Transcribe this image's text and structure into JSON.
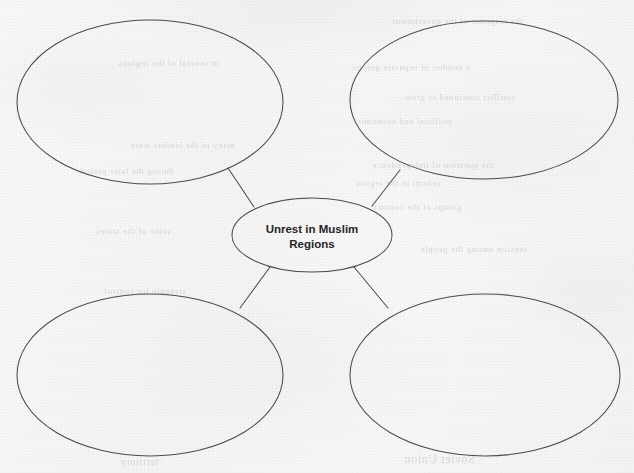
{
  "worksheet": {
    "type": "concept-map",
    "paper_color": "#f6f6f4",
    "ink_color": "#4a4a52",
    "text_color": "#26262b",
    "width": 634,
    "height": 473
  },
  "diagram": {
    "center_node": {
      "id": "center",
      "label_line1": "Unrest in Muslim",
      "label_line2": "Regions",
      "filled": true,
      "cx": 312,
      "cy": 235,
      "rx": 80,
      "ry": 37
    },
    "branch_nodes": [
      {
        "id": "top-left",
        "label": "",
        "filled": false,
        "cx": 150,
        "cy": 102,
        "rx": 133,
        "ry": 82
      },
      {
        "id": "top-right",
        "label": "",
        "filled": false,
        "cx": 484,
        "cy": 100,
        "rx": 134,
        "ry": 79
      },
      {
        "id": "bottom-left",
        "label": "",
        "filled": false,
        "cx": 150,
        "cy": 375,
        "rx": 133,
        "ry": 81
      },
      {
        "id": "bottom-right",
        "label": "",
        "filled": false,
        "cx": 485,
        "cy": 375,
        "rx": 135,
        "ry": 81
      }
    ],
    "connectors": [
      {
        "id": "center-to-top-left",
        "from": "top-left",
        "to": "center",
        "x1": 228,
        "y1": 168,
        "x2": 254,
        "y2": 207
      },
      {
        "id": "center-to-top-right",
        "from": "top-right",
        "to": "center",
        "x1": 400,
        "y1": 170,
        "x2": 372,
        "y2": 206
      },
      {
        "id": "center-to-bottom-left",
        "from": "bottom-left",
        "to": "center",
        "x1": 270,
        "y1": 267,
        "x2": 240,
        "y2": 308
      },
      {
        "id": "center-to-bottom-right",
        "from": "bottom-right",
        "to": "center",
        "x1": 354,
        "y1": 267,
        "x2": 388,
        "y2": 308
      }
    ]
  },
  "ghost_bleedthrough": [
    {
      "text": "the response of the government",
      "x": 392,
      "y": 16,
      "size": 9
    },
    {
      "text": "in several of the regions",
      "x": 118,
      "y": 58,
      "size": 9
    },
    {
      "text": "a number of separate groups",
      "x": 352,
      "y": 62,
      "size": 9
    },
    {
      "text": "conflict continued to grow",
      "x": 404,
      "y": 92,
      "size": 9
    },
    {
      "text": "political and economic",
      "x": 356,
      "y": 116,
      "size": 9
    },
    {
      "text": "many of the leaders were",
      "x": 130,
      "y": 140,
      "size": 9
    },
    {
      "text": "during the later period",
      "x": 80,
      "y": 166,
      "size": 9
    },
    {
      "text": "the question of independence",
      "x": 372,
      "y": 160,
      "size": 9
    },
    {
      "text": "reform in the region",
      "x": 356,
      "y": 178,
      "size": 9
    },
    {
      "text": "groups of the country",
      "x": 372,
      "y": 202,
      "size": 9
    },
    {
      "text": "some of the states",
      "x": 96,
      "y": 226,
      "size": 9
    },
    {
      "text": "tension among the people",
      "x": 420,
      "y": 244,
      "size": 9
    },
    {
      "text": "struggle for control",
      "x": 104,
      "y": 286,
      "size": 9
    },
    {
      "text": "Soviet Union",
      "x": 404,
      "y": 452,
      "size": 12
    },
    {
      "text": "territory",
      "x": 120,
      "y": 456,
      "size": 10
    }
  ]
}
